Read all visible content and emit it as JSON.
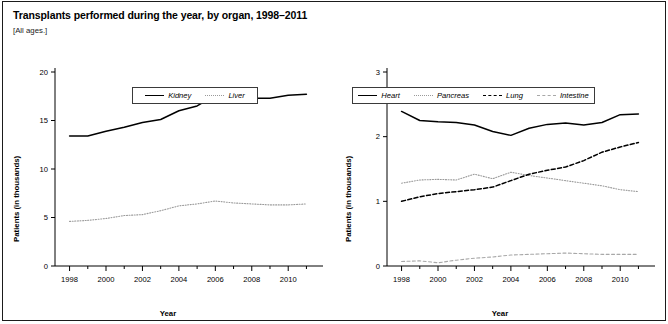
{
  "figure": {
    "title": "Transplants performed during the year, by organ, 1998–2011",
    "subtitle": "[All ages.]",
    "border_color": "#1b1b1b",
    "background": "#ffffff"
  },
  "chart_data": [
    {
      "type": "line",
      "panel": "left",
      "title": "",
      "xlabel": "Year",
      "ylabel": "Patients (in thousands)",
      "xlim": [
        1997.2,
        2011.8
      ],
      "ylim": [
        0,
        20
      ],
      "yticks": [
        0,
        5,
        10,
        15,
        20
      ],
      "ytick_labels": [
        "0",
        "5",
        "10",
        "15",
        "20"
      ],
      "xticks": [
        1998,
        2000,
        2002,
        2004,
        2006,
        2008,
        2010
      ],
      "xtick_labels": [
        "1998",
        "2000",
        "2002",
        "2004",
        "2006",
        "2008",
        "2010"
      ],
      "x": [
        1998,
        1999,
        2000,
        2001,
        2002,
        2003,
        2004,
        2005,
        2006,
        2007,
        2008,
        2009,
        2010,
        2011
      ],
      "grid": false,
      "legend_position": "top-center",
      "series": [
        {
          "name": "Kidney",
          "style": "solid",
          "color": "#000000",
          "values": [
            13.4,
            13.4,
            13.9,
            14.3,
            14.8,
            15.1,
            16.0,
            16.5,
            17.6,
            17.2,
            17.3,
            17.3,
            17.6,
            17.7
          ]
        },
        {
          "name": "Liver",
          "style": "dotted",
          "color": "#9a9a9a",
          "values": [
            4.6,
            4.7,
            4.9,
            5.2,
            5.3,
            5.7,
            6.2,
            6.4,
            6.7,
            6.5,
            6.4,
            6.3,
            6.3,
            6.4
          ]
        }
      ]
    },
    {
      "type": "line",
      "panel": "right",
      "title": "",
      "xlabel": "Year",
      "ylabel": "Patients (in thousands)",
      "xlim": [
        1997.2,
        2011.8
      ],
      "ylim": [
        0,
        3
      ],
      "yticks": [
        0,
        1,
        2,
        3
      ],
      "ytick_labels": [
        "0",
        "1",
        "2",
        "3"
      ],
      "xticks": [
        1998,
        2000,
        2002,
        2004,
        2006,
        2008,
        2010
      ],
      "xtick_labels": [
        "1998",
        "2000",
        "2002",
        "2004",
        "2006",
        "2008",
        "2010"
      ],
      "x": [
        1998,
        1999,
        2000,
        2001,
        2002,
        2003,
        2004,
        2005,
        2006,
        2007,
        2008,
        2009,
        2010,
        2011
      ],
      "grid": false,
      "legend_position": "top-center",
      "series": [
        {
          "name": "Heart",
          "style": "solid",
          "color": "#000000",
          "values": [
            2.39,
            2.25,
            2.23,
            2.22,
            2.18,
            2.08,
            2.02,
            2.13,
            2.19,
            2.21,
            2.18,
            2.22,
            2.34,
            2.35
          ]
        },
        {
          "name": "Pancreas",
          "style": "dotted",
          "color": "#9a9a9a",
          "values": [
            1.28,
            1.33,
            1.34,
            1.33,
            1.42,
            1.35,
            1.45,
            1.4,
            1.36,
            1.32,
            1.28,
            1.24,
            1.18,
            1.15
          ]
        },
        {
          "name": "Lung",
          "style": "dashed",
          "color": "#000000",
          "values": [
            1.0,
            1.07,
            1.12,
            1.15,
            1.18,
            1.22,
            1.32,
            1.42,
            1.48,
            1.53,
            1.63,
            1.76,
            1.84,
            1.91
          ]
        },
        {
          "name": "Intestine",
          "style": "dashed-light",
          "color": "#a8a8a8",
          "values": [
            0.07,
            0.08,
            0.05,
            0.09,
            0.12,
            0.14,
            0.17,
            0.18,
            0.19,
            0.2,
            0.19,
            0.18,
            0.18,
            0.18
          ]
        }
      ]
    }
  ]
}
